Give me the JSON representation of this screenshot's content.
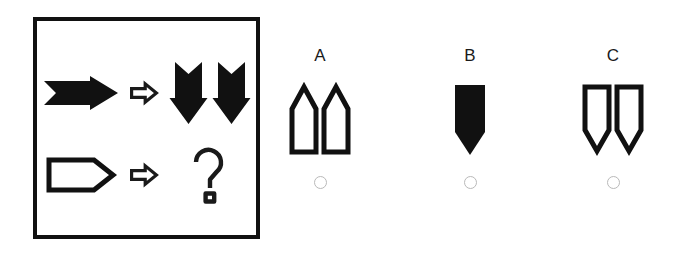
{
  "puzzle": {
    "type": "visual-analogy",
    "prompt_panel": {
      "rows": [
        {
          "source": {
            "icon": "right-arrow-solid-icon",
            "description": "solid black arrow pointing right",
            "fill": "solid",
            "direction": "right",
            "count": 1
          },
          "operator": {
            "icon": "transform-arrow-icon",
            "glyph": "⇨",
            "description": "outlined right arrow meaning transforms into"
          },
          "result": {
            "icon": "down-arrow-solid-pair-icon",
            "description": "two solid black arrows pointing down",
            "fill": "solid",
            "direction": "down",
            "count": 2
          }
        },
        {
          "source": {
            "icon": "right-pentagon-outline-icon",
            "description": "outlined banner pentagon pointing right",
            "fill": "outline",
            "direction": "right",
            "count": 1
          },
          "operator": {
            "icon": "transform-arrow-icon",
            "glyph": "⇨",
            "description": "outlined right arrow meaning transforms into"
          },
          "result": {
            "icon": "question-mark-outline-icon",
            "glyph": "?",
            "description": "outlined question mark marking the missing answer"
          }
        }
      ]
    },
    "options": [
      {
        "label": "A",
        "figure": {
          "icon": "up-pentagon-outline-pair-icon",
          "description": "two outlined banner pentagons pointing up",
          "fill": "outline",
          "direction": "up",
          "count": 2
        },
        "radio": {
          "name": "option-a-radio",
          "selected": false
        }
      },
      {
        "label": "B",
        "figure": {
          "icon": "down-pentagon-solid-single-icon",
          "description": "one solid black banner pentagon pointing down",
          "fill": "solid",
          "direction": "down",
          "count": 1
        },
        "radio": {
          "name": "option-b-radio",
          "selected": false
        }
      },
      {
        "label": "C",
        "figure": {
          "icon": "down-pentagon-outline-pair-icon",
          "description": "two outlined banner pentagons pointing down",
          "fill": "outline",
          "direction": "down",
          "count": 2
        },
        "radio": {
          "name": "option-c-radio",
          "selected": false
        }
      }
    ]
  },
  "colors": {
    "ink": "#111111",
    "outline": "#1a1a1a",
    "paper": "#ffffff",
    "radio_border": "#b9b9b9"
  }
}
